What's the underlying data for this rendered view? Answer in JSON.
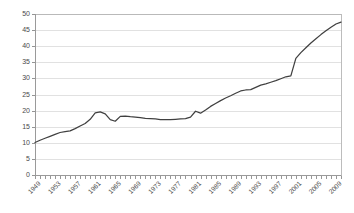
{
  "chart_data": {
    "type": "line",
    "title": "",
    "xlabel": "",
    "ylabel": "",
    "ylim": [
      0,
      50
    ],
    "xlim": [
      1949,
      2010
    ],
    "grid": true,
    "legend": false,
    "y_ticks": [
      0,
      5,
      10,
      15,
      20,
      25,
      30,
      35,
      40,
      45,
      50
    ],
    "x_tick_labels": [
      "1949",
      "1953",
      "1957",
      "1961",
      "1965",
      "1969",
      "1973",
      "1977",
      "1981",
      "1985",
      "1989",
      "1993",
      "1997",
      "2001",
      "2005",
      "2009"
    ],
    "x_tick_step_years": 1,
    "x_label_step_years": 4,
    "series": [
      {
        "name": "",
        "color": "#404040",
        "x": [
          1949,
          1950,
          1951,
          1952,
          1953,
          1954,
          1955,
          1956,
          1957,
          1958,
          1959,
          1960,
          1961,
          1962,
          1963,
          1964,
          1965,
          1966,
          1967,
          1968,
          1969,
          1970,
          1971,
          1972,
          1973,
          1974,
          1975,
          1976,
          1977,
          1978,
          1979,
          1980,
          1981,
          1982,
          1983,
          1984,
          1985,
          1986,
          1987,
          1988,
          1989,
          1990,
          1991,
          1992,
          1993,
          1994,
          1995,
          1996,
          1997,
          1998,
          1999,
          2000,
          2001,
          2002,
          2003,
          2004,
          2005,
          2006,
          2007,
          2008,
          2009,
          2010
        ],
        "values": [
          10.1,
          10.8,
          11.4,
          12.0,
          12.6,
          13.2,
          13.5,
          13.7,
          14.4,
          15.2,
          16.0,
          17.3,
          19.3,
          19.6,
          19.0,
          17.2,
          16.7,
          18.2,
          18.3,
          18.1,
          18.0,
          17.8,
          17.6,
          17.5,
          17.4,
          17.2,
          17.2,
          17.2,
          17.3,
          17.4,
          17.5,
          18.0,
          19.8,
          19.2,
          20.2,
          21.3,
          22.2,
          23.1,
          23.9,
          24.6,
          25.4,
          26.1,
          26.4,
          26.5,
          27.2,
          27.9,
          28.3,
          28.8,
          29.3,
          29.9,
          30.5,
          30.8,
          36.2,
          38.0,
          39.5,
          41.0,
          42.3,
          43.6,
          44.8,
          45.9,
          46.9,
          47.5
        ]
      }
    ]
  }
}
